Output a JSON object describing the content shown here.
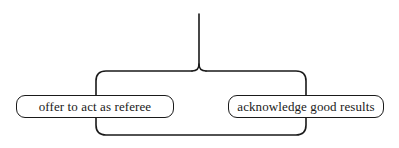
{
  "diagram": {
    "type": "bracket-branch",
    "stroke_color": "#1a1a1a",
    "background": "#ffffff",
    "nodes": [
      {
        "id": "left",
        "label": "offer to act as referee"
      },
      {
        "id": "right",
        "label": "acknowledge good results"
      }
    ]
  }
}
